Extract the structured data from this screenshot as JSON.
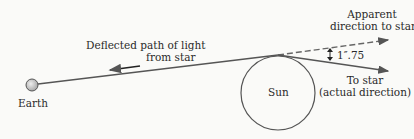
{
  "diagram": {
    "labels": {
      "deflected_path": [
        "Deflected path of light",
        "from star"
      ],
      "apparent": [
        "Apparent",
        "direction to star"
      ],
      "angle": "1″.75",
      "actual": [
        "To star",
        "(actual direction)"
      ],
      "sun": "Sun",
      "earth": "Earth"
    },
    "colors": {
      "line": "#555555",
      "text": "#2a2a2a",
      "earth_fill": "#cccccc"
    }
  }
}
